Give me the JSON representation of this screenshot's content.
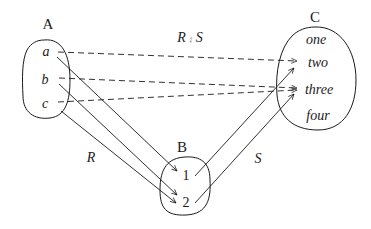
{
  "diagram": {
    "type": "relation-composition",
    "sets": {
      "A": {
        "label": "A",
        "elements": [
          "a",
          "b",
          "c"
        ]
      },
      "B": {
        "label": "B",
        "elements": [
          "1",
          "2"
        ]
      },
      "C": {
        "label": "C",
        "elements": [
          "one",
          "two",
          "three",
          "four"
        ]
      }
    },
    "relations": {
      "R": {
        "label": "R",
        "style": "solid",
        "pairs": [
          [
            "a",
            "1"
          ],
          [
            "b",
            "2"
          ],
          [
            "c",
            "2"
          ]
        ]
      },
      "S": {
        "label": "S",
        "style": "solid",
        "pairs": [
          [
            "1",
            "two"
          ],
          [
            "2",
            "three"
          ]
        ]
      },
      "composition": {
        "label": "R ⨾ S",
        "style": "dashed",
        "pairs": [
          [
            "a",
            "two"
          ],
          [
            "b",
            "three"
          ],
          [
            "c",
            "three"
          ]
        ]
      }
    },
    "colors": {
      "stroke": "#1a1a1a",
      "background": "#ffffff"
    }
  }
}
